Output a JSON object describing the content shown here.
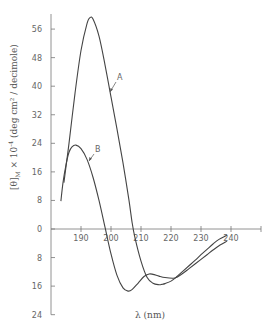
{
  "chart_data": {
    "type": "line",
    "title": "",
    "xlabel": "λ (nm)",
    "ylabel": "[θ]M × 10⁻⁴ (deg cm² / decimole)",
    "x_ticks": [
      190,
      200,
      210,
      220,
      230,
      240
    ],
    "y_ticks": [
      56,
      48,
      40,
      32,
      24,
      16,
      8,
      0,
      8,
      16,
      24
    ],
    "y_tick_values": [
      56,
      48,
      40,
      32,
      24,
      16,
      8,
      0,
      -8,
      -16,
      -24
    ],
    "xlim": [
      180,
      250
    ],
    "ylim": [
      -24,
      60
    ],
    "grid": false,
    "legend": "none (curves labeled inline)",
    "series": [
      {
        "name": "A",
        "x": [
          184.3,
          186,
          188,
          190,
          192,
          193,
          194,
          196,
          198,
          200,
          202,
          204,
          206,
          207,
          208,
          210,
          212,
          214,
          216,
          217,
          218,
          220,
          222,
          224,
          226,
          228,
          230,
          232,
          234,
          236,
          238.7
        ],
        "y": [
          13,
          24,
          38,
          50,
          57.5,
          59.2,
          58.8,
          54,
          46,
          37,
          28,
          18.5,
          8,
          2,
          -2.5,
          -9,
          -13.5,
          -15.2,
          -15.6,
          -15.5,
          -15.3,
          -14.6,
          -13.3,
          -11.8,
          -10.3,
          -8.8,
          -7.2,
          -5.7,
          -4.2,
          -2.9,
          -1.7
        ]
      },
      {
        "name": "B",
        "x": [
          183.3,
          184,
          185,
          186,
          187,
          188.3,
          190,
          192,
          194,
          196,
          198,
          200,
          202,
          204,
          205.7,
          207,
          209,
          211,
          212.7,
          214,
          216,
          218,
          220.7,
          222,
          224,
          226,
          228,
          230,
          232,
          234,
          236,
          238.7
        ],
        "y": [
          7.8,
          13,
          18,
          21.5,
          23,
          23.5,
          22.5,
          19.5,
          14.5,
          8,
          0.5,
          -7,
          -13,
          -16.5,
          -17.4,
          -17,
          -15.2,
          -13.3,
          -12.6,
          -12.7,
          -13.2,
          -13.6,
          -13.8,
          -13.5,
          -12.4,
          -11.1,
          -9.8,
          -8.5,
          -7.2,
          -5.9,
          -4.7,
          -3.4
        ]
      }
    ],
    "annotations": [
      {
        "text": "A",
        "points_to_series": "A"
      },
      {
        "text": "B",
        "points_to_series": "B"
      }
    ]
  },
  "labels": {
    "x_axis_title": "λ (nm)",
    "y_axis_title_main": "[θ]",
    "y_axis_title_sub": "M",
    "y_axis_title_mult": " × 10",
    "y_axis_title_exp": "-4",
    "y_axis_title_units": " (deg cm² / decimole)",
    "curve_a": "A",
    "curve_b": "B"
  }
}
